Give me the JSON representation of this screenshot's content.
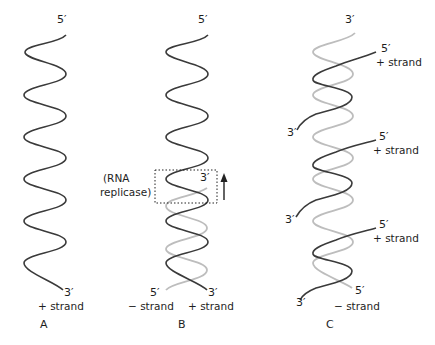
{
  "figure": {
    "panels": [
      {
        "id": "A",
        "label": "A",
        "top_end": "5′",
        "bottom_end": "3′",
        "strand_label": "+ strand"
      },
      {
        "id": "B",
        "label": "B",
        "top_end": "5′",
        "new_strand_3end": "3′",
        "enzyme_label_line1": "(RNA",
        "enzyme_label_line2": "replicase)",
        "bottom_left_end": "5′",
        "bottom_right_end": "3′",
        "minus_strand_label": "− strand",
        "plus_strand_label": "+ strand"
      },
      {
        "id": "C",
        "label": "C",
        "top_end": "3′",
        "new_strands": [
          {
            "five_prime": "5′",
            "strand_label": "+ strand",
            "three_prime": "3′"
          },
          {
            "five_prime": "5′",
            "strand_label": "+ strand",
            "three_prime": "3′"
          },
          {
            "five_prime": "5′",
            "strand_label": "+ strand",
            "three_prime": "3′"
          }
        ],
        "bottom_right_end": "5′",
        "minus_strand_label": "− strand"
      }
    ],
    "colors": {
      "plus_strand": "#3a3a3a",
      "minus_strand": "#bdbdbd",
      "box": "#222222"
    }
  }
}
